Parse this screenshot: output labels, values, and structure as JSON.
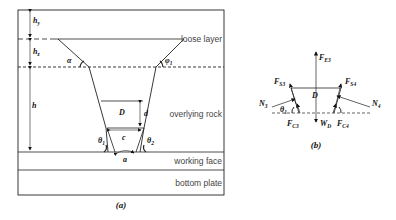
{
  "figure_a": {
    "caption": "(a)",
    "layers": {
      "loose": "loose layer",
      "rock": "overlying rock",
      "working": "working face",
      "bottom": "bottom plate"
    },
    "symbols": {
      "hy": "h",
      "hy_sub": "y",
      "hz": "h",
      "hz_sub": "z",
      "h": "h",
      "alpha": "α",
      "phi1": "φ",
      "phi1_sub": "1",
      "D": "D",
      "d": "d",
      "c": "c",
      "a": "a",
      "theta1": "θ",
      "theta1_sub": "1",
      "theta2": "θ",
      "theta2_sub": "2"
    }
  },
  "figure_b": {
    "caption": "(b)",
    "symbols": {
      "FE3": "F",
      "FE3_sub": "E3",
      "FS3": "F",
      "FS3_sub": "S3",
      "FS4": "F",
      "FS4_sub": "S4",
      "N3": "N",
      "N3_sub": "3",
      "N4": "N",
      "N4_sub": "4",
      "D": "D",
      "theta1": "θ",
      "theta1_sub": "1",
      "FC3": "F",
      "FC3_sub": "C3",
      "FC4": "F",
      "FC4_sub": "C4",
      "WD": "W",
      "WD_sub": "D"
    }
  }
}
